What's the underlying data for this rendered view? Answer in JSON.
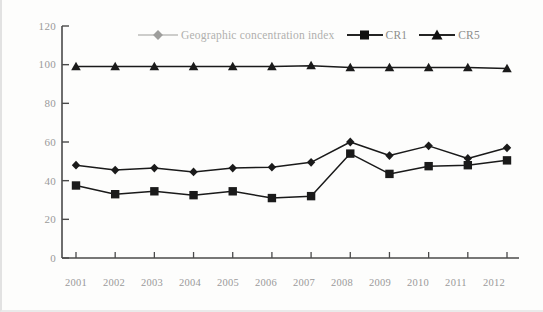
{
  "chart_data": {
    "type": "line",
    "title": "",
    "subtitle": "",
    "xlabel": "",
    "ylabel": "",
    "categories": [
      "2001",
      "2002",
      "2003",
      "2004",
      "2005",
      "2006",
      "2007",
      "2008",
      "2009",
      "2010",
      "2011",
      "2012"
    ],
    "ylim": [
      0,
      120
    ],
    "yticks": [
      0,
      20,
      40,
      60,
      80,
      100,
      120
    ],
    "grid": false,
    "legend_position": "top-center",
    "series": [
      {
        "name": "Geographic concentration index",
        "marker": "diamond",
        "color": "#1a1a1a",
        "values": [
          48,
          45.5,
          46.5,
          44.5,
          46.5,
          47,
          49.5,
          60,
          53,
          58,
          51.5,
          57
        ]
      },
      {
        "name": "CR1",
        "marker": "square",
        "color": "#1a1a1a",
        "values": [
          37.5,
          33,
          34.5,
          32.5,
          34.5,
          31,
          32,
          54,
          43.5,
          47.5,
          48,
          50.5
        ]
      },
      {
        "name": "CR5",
        "marker": "triangle",
        "color": "#1a1a1a",
        "values": [
          99,
          99,
          99,
          99,
          99,
          99,
          99.5,
          98.5,
          98.5,
          98.5,
          98.5,
          98
        ]
      }
    ]
  },
  "axes": {
    "y_tick_labels": [
      "120",
      "100",
      "80",
      "60",
      "40",
      "20",
      "0"
    ],
    "x_tick_labels": [
      "2001",
      "2002",
      "2003",
      "2004",
      "2005",
      "2006",
      "2007",
      "2008",
      "2009",
      "2010",
      "2011",
      "2012"
    ]
  },
  "legend": {
    "items": [
      {
        "label": "Geographic concentration index",
        "marker": "diamond-icon"
      },
      {
        "label": "CR1",
        "marker": "square-icon"
      },
      {
        "label": "CR5",
        "marker": "triangle-icon"
      }
    ]
  },
  "colors": {
    "axis": "#4a4a4a",
    "series": "#1a1a1a",
    "tick_text": "#9a9a9a",
    "legend_faded": "#b0b0ae",
    "background": "#fdfdfc"
  }
}
